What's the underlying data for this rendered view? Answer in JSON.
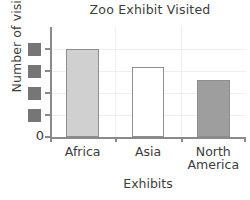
{
  "chart_data": {
    "type": "bar",
    "title": "Zoo Exhibit Visited",
    "xlabel": "Exhibits",
    "ylabel": "Number of visitors",
    "categories": [
      "Africa",
      "Asia",
      "North America"
    ],
    "category_lines": [
      [
        "Africa"
      ],
      [
        "Asia"
      ],
      [
        "North",
        "America"
      ]
    ],
    "values": [
      4,
      3.2,
      2.6
    ],
    "ylim": [
      0,
      5
    ],
    "ytick_values": [
      0,
      1,
      2,
      3,
      4
    ],
    "ytick_labels": [
      "0",
      "",
      "",
      "",
      ""
    ],
    "ytick_labels_redacted": [
      false,
      true,
      true,
      true,
      true
    ],
    "grid": true,
    "legend": "none",
    "series": [
      {
        "name": "Number of visitors",
        "values": [
          4,
          3.2,
          2.6
        ],
        "bar_colors": [
          "#d0d0d0",
          "#ffffff",
          "#9e9e9e"
        ],
        "bar_edge_color": "#8e8e8e"
      }
    ]
  },
  "axes": {
    "axis_color": "#8a8a8a",
    "grid_color": "#eeeeee",
    "text_color": "#3d3d3d",
    "redaction_color": "#767676"
  },
  "zero_label": "0"
}
